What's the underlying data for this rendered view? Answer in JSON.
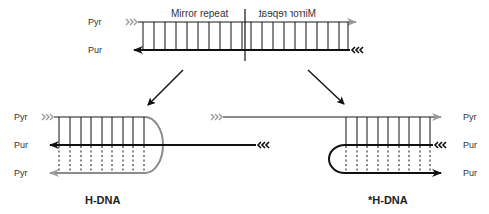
{
  "colors": {
    "pyr_strand": "#8c8c8c",
    "pur_strand": "#111111",
    "background": "#ffffff",
    "hbond": "#111111"
  },
  "top_duplex": {
    "strand_labels": [
      "Pyr",
      "Pur"
    ],
    "mirror_repeat_left": "Mirror repeat",
    "mirror_repeat_right": "Mirror repeat",
    "five_prime_marker": "»»",
    "three_prime_marker": "«««"
  },
  "arrows": [
    {
      "direction": "down-left",
      "target": "H-DNA"
    },
    {
      "direction": "down-right",
      "target": "*H-DNA"
    }
  ],
  "h_dna": {
    "title": "H-DNA",
    "strand_labels": [
      "Pyr",
      "Pur",
      "Pyr"
    ]
  },
  "star_h_dna": {
    "title": "*H-DNA",
    "strand_labels": [
      "Pyr",
      "Pur",
      "Pur"
    ]
  }
}
